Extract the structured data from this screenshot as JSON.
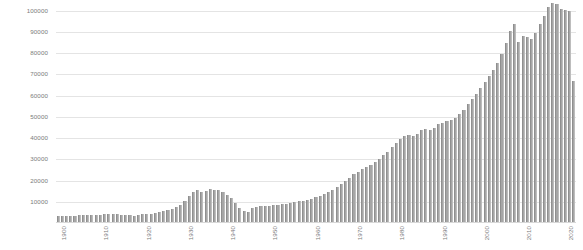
{
  "chart_data": {
    "type": "bar",
    "title": "",
    "subtitle": "",
    "xlabel": "",
    "ylabel": "",
    "grid": true,
    "legend": false,
    "legend_position": "none",
    "bar_color": "#a6a6a6",
    "grid_color": "#e4e4e4",
    "axis_text_color": "#7b7b7b",
    "ylim": [
      0,
      105000
    ],
    "yticks": [
      10000,
      20000,
      30000,
      40000,
      50000,
      60000,
      70000,
      80000,
      90000,
      100000
    ],
    "ytick_labels": [
      "10000",
      "20000",
      "30000",
      "40000",
      "50000",
      "60000",
      "70000",
      "80000",
      "90000",
      "100000"
    ],
    "xtick_labels": [
      "1900",
      "1910",
      "1920",
      "1930",
      "1940",
      "1950",
      "1960",
      "1970",
      "1980",
      "1990",
      "2000",
      "2010",
      "2020"
    ],
    "xtick_categories": [
      1900,
      1910,
      1920,
      1930,
      1940,
      1950,
      1960,
      1970,
      1980,
      1990,
      2000,
      2010,
      2020
    ],
    "categories": [
      1900,
      1901,
      1902,
      1903,
      1904,
      1905,
      1906,
      1907,
      1908,
      1909,
      1910,
      1911,
      1912,
      1913,
      1914,
      1915,
      1916,
      1917,
      1918,
      1919,
      1920,
      1921,
      1922,
      1923,
      1924,
      1925,
      1926,
      1927,
      1928,
      1929,
      1930,
      1931,
      1932,
      1933,
      1934,
      1935,
      1936,
      1937,
      1938,
      1939,
      1940,
      1941,
      1942,
      1943,
      1944,
      1945,
      1946,
      1947,
      1948,
      1949,
      1950,
      1951,
      1952,
      1953,
      1954,
      1955,
      1956,
      1957,
      1958,
      1959,
      1960,
      1961,
      1962,
      1963,
      1964,
      1965,
      1966,
      1967,
      1968,
      1969,
      1970,
      1971,
      1972,
      1973,
      1974,
      1975,
      1976,
      1977,
      1978,
      1979,
      1980,
      1981,
      1982,
      1983,
      1984,
      1985,
      1986,
      1987,
      1988,
      1989,
      1990,
      1991,
      1992,
      1993,
      1994,
      1995,
      1996,
      1997,
      1998,
      1999,
      2000,
      2001,
      2002,
      2003,
      2004,
      2005,
      2006,
      2007,
      2008,
      2009,
      2010,
      2011,
      2012,
      2013,
      2014,
      2015,
      2016,
      2017,
      2018,
      2019,
      2020,
      2021,
      2022
    ],
    "values": [
      3200,
      3300,
      3400,
      3500,
      3500,
      3600,
      3700,
      3800,
      3800,
      3900,
      4000,
      4100,
      4300,
      4400,
      4200,
      3900,
      3700,
      3600,
      3400,
      3900,
      4300,
      4200,
      4400,
      4800,
      5200,
      5600,
      6200,
      6800,
      7600,
      8600,
      10200,
      12500,
      14800,
      15400,
      14600,
      15100,
      15900,
      15500,
      15400,
      14500,
      13200,
      11800,
      9500,
      7200,
      5600,
      5200,
      6900,
      7600,
      7800,
      7900,
      8100,
      8300,
      8600,
      8900,
      9100,
      9400,
      9800,
      10200,
      10600,
      11000,
      11500,
      12100,
      12800,
      13600,
      14500,
      15500,
      16800,
      18200,
      19700,
      21400,
      23000,
      24200,
      25400,
      26600,
      27500,
      28600,
      30100,
      31800,
      33600,
      35600,
      37600,
      39400,
      40800,
      41600,
      41200,
      42100,
      43800,
      44200,
      43600,
      44900,
      46400,
      47200,
      47900,
      48600,
      49500,
      51200,
      53400,
      55900,
      58400,
      60900,
      63800,
      66600,
      69400,
      72100,
      75400,
      79500,
      84600,
      90600,
      93700,
      85400,
      88200,
      87600,
      86500,
      89400,
      93500,
      97700,
      101800,
      103600,
      102900,
      100600,
      100200,
      99800,
      66800
    ]
  }
}
